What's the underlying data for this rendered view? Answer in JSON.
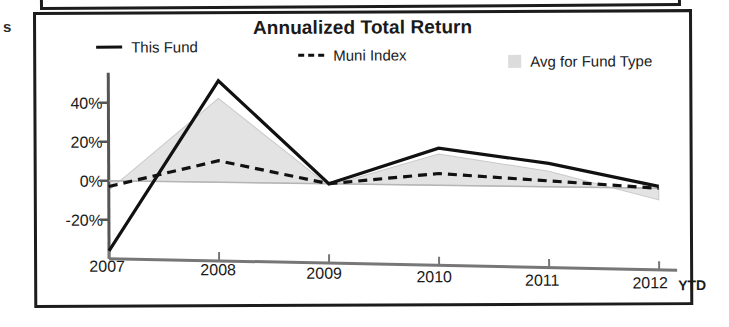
{
  "margin_fragment": "s",
  "chart": {
    "title": "Annualized Total Return",
    "legend": [
      {
        "label": "This Fund",
        "marker": "solid-line",
        "color": "#111111"
      },
      {
        "label": "Muni Index",
        "marker": "dashed-line",
        "color": "#111111"
      },
      {
        "label": "Avg for Fund Type",
        "marker": "filled-square",
        "color": "#dcdcdc"
      }
    ],
    "ytd_label": "YTD"
  },
  "chart_data": {
    "type": "line",
    "title": "Annualized Total Return",
    "xlabel": "",
    "ylabel": "",
    "x": [
      "2007",
      "2008",
      "2009",
      "2010",
      "2011",
      "2012"
    ],
    "categories": [
      "2007",
      "2008",
      "2009",
      "2010",
      "2011",
      "2012"
    ],
    "ylim": [
      -40,
      55
    ],
    "yticks": [
      -20,
      0,
      20,
      40
    ],
    "ytick_labels": [
      "-20%",
      "0%",
      "20%",
      "40%"
    ],
    "grid": false,
    "legend_position": "top",
    "series": [
      {
        "name": "This Fund",
        "style": "solid",
        "color": "#111111",
        "values": [
          -36,
          52,
          0,
          19,
          12,
          1
        ]
      },
      {
        "name": "Muni Index",
        "style": "dashed",
        "color": "#111111",
        "values": [
          -3,
          11,
          0,
          6,
          3,
          0
        ]
      },
      {
        "name": "Avg for Fund Type",
        "style": "area",
        "color": "#e3e3e3",
        "values": [
          -5,
          43,
          -1,
          16,
          8,
          -6
        ]
      }
    ]
  },
  "yticks": [
    {
      "label": "40%"
    },
    {
      "label": "20%"
    },
    {
      "label": "0%"
    },
    {
      "label": "-20%"
    }
  ],
  "xticks": [
    {
      "label": "2007"
    },
    {
      "label": "2008"
    },
    {
      "label": "2009"
    },
    {
      "label": "2010"
    },
    {
      "label": "2011"
    },
    {
      "label": "2012"
    }
  ]
}
